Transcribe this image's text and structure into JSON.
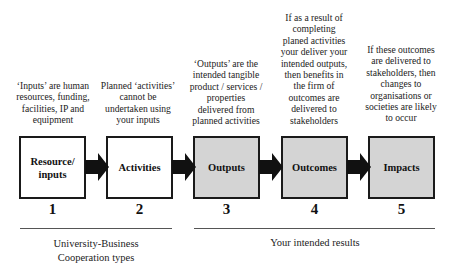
{
  "descriptions": [
    "‘Inputs’ are human resources, funding, facilities, IP and equipment",
    "Planned ‘activities’ cannot be undertaken using your inputs",
    "‘Outputs’ are the intended tangible product / services / properties delivered from planned activities",
    "If as a result of completing planed activities your deliver your intended outputs, then benefits in the firm of outcomes are delivered to stakeholders",
    "If these outcomes are delivered to stakeholders, then changes to organisations or societies are likely to occur"
  ],
  "steps": [
    {
      "label": "Resource/ inputs",
      "number": "1",
      "fill": "#ffffff"
    },
    {
      "label": "Activities",
      "number": "2",
      "fill": "#ffffff"
    },
    {
      "label": "Outputs",
      "number": "3",
      "fill": "#d4d4d4"
    },
    {
      "label": "Outcomes",
      "number": "4",
      "fill": "#d4d4d4"
    },
    {
      "label": "Impacts",
      "number": "5",
      "fill": "#d4d4d4"
    }
  ],
  "groups": [
    {
      "label": "University-Business Cooperation types"
    },
    {
      "label": "Your intended results"
    }
  ]
}
